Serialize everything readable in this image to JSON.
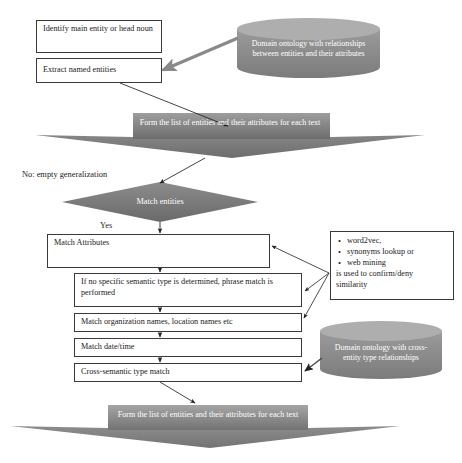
{
  "diagram": {
    "type": "flowchart",
    "colors": {
      "banner_fill_light": "#9a9a9a",
      "banner_fill_dark": "#6f6f6f",
      "diamond_fill": "#808080",
      "cylinder_fill": "#8c8c8c",
      "cylinder_top": "#a8a8a8",
      "box_border": "#3a3a3a",
      "box_fill": "#ffffff",
      "arrow_thin": "#2b2b2b",
      "arrow_thick": "#8a8a8a",
      "text_on_dark": "#ffffff",
      "text_on_light": "#1a1a1a"
    }
  },
  "nodes": {
    "identify_entity": {
      "label": "Identify main entity or head noun"
    },
    "extract_entities": {
      "label": "Extract named entities"
    },
    "ontology_top": {
      "label": "Domain ontology with relationships between entities and their attributes"
    },
    "banner_top": {
      "label": "Form the list of entities and their attributes for each text"
    },
    "match_entities": {
      "label": "Match entities"
    },
    "match_attributes": {
      "label": "Match Attributes"
    },
    "phrase_match": {
      "label": "If no specific semantic type is determined, phrase match is performed"
    },
    "org_names": {
      "label": "Match organization names, location names etc"
    },
    "date_time": {
      "label": "Match date/time"
    },
    "cross_semantic": {
      "label": "Cross-semantic type match"
    },
    "ontology_bottom": {
      "label": "Domain ontology with cross-entity type relationships"
    },
    "banner_bottom": {
      "label": "Form the list of entities and their attributes for each text"
    }
  },
  "edge_labels": {
    "no_empty_generalization": "No: empty generalization",
    "yes": "Yes"
  },
  "side_note": {
    "bullets": [
      "word2vec,",
      "synonyms lookup or",
      "web mining"
    ],
    "tail_line_1": "is used to confirm/deny",
    "tail_line_2": "similarity"
  }
}
